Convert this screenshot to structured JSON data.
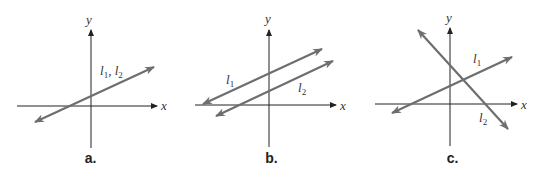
{
  "colors": {
    "axis": "#222222",
    "line": "#6e6e6e",
    "label": "#333333",
    "background": "#ffffff"
  },
  "axes": {
    "x_label": "x",
    "y_label": "y"
  },
  "panels": [
    {
      "caption": "a.",
      "description": "Coincident lines",
      "line_label": "l1, l2",
      "line_label_base": "l",
      "sub1": "1",
      "sep": ", ",
      "sub2": "2"
    },
    {
      "caption": "b.",
      "description": "Parallel lines",
      "l1_base": "l",
      "l1_sub": "1",
      "l2_base": "l",
      "l2_sub": "2"
    },
    {
      "caption": "c.",
      "description": "Intersecting lines",
      "l1_base": "l",
      "l1_sub": "1",
      "l2_base": "l",
      "l2_sub": "2"
    }
  ]
}
